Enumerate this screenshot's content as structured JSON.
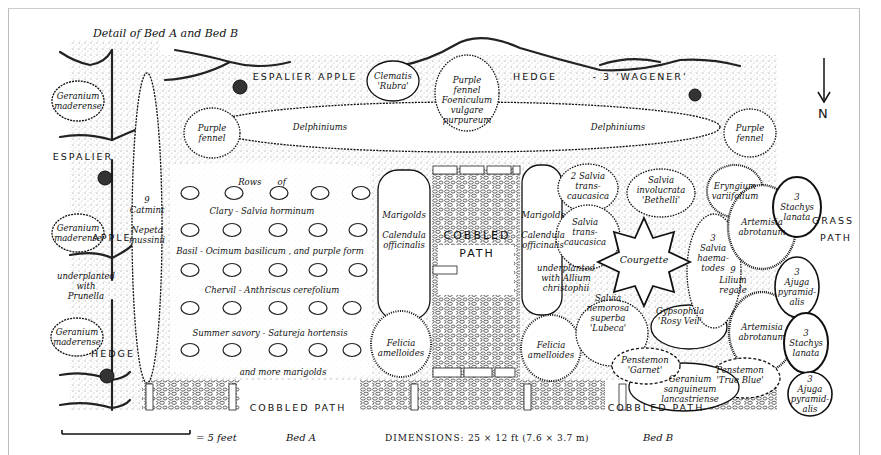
{
  "title": "Detail of Bed A and Bed B",
  "north_label": "N",
  "scale": {
    "label": "= 5 feet"
  },
  "beds": {
    "a": "Bed A",
    "b": "Bed B"
  },
  "dimensions": {
    "prefix": "DIMENSIONS:",
    "value": "25 × 12 ft (7.6 × 3.7 m)"
  },
  "hedge_labels": {
    "top_1": "ESPALIER APPLE",
    "top_2": "HEDGE",
    "top_3": "- 3 'WAGENER'",
    "left_1": "ESPALIER",
    "left_2": "APPLE",
    "left_3": "HEDGE"
  },
  "paths": {
    "cobbled_bottom_left": "COBBLED PATH",
    "cobbled_bottom_right": "COBBLED PATH",
    "cobbled_center_1": "COBBLED",
    "cobbled_center_2": "PATH",
    "grass_1": "GRASS",
    "grass_2": "PATH"
  },
  "plants": {
    "clematis": "Clematis\n'Rubra'",
    "purple_fennel_center": "Purple\nfennel\nFoeniculum\nvulgare\npurpureum",
    "purple_fennel_left": "Purple\nfennel",
    "purple_fennel_right": "Purple\nfennel",
    "delphiniums_left": "Delphiniums",
    "delphiniums_right": "Delphiniums",
    "geranium_1": "Geranium\nmaderense",
    "geranium_2": "Geranium\nmaderense",
    "geranium_3": "Geranium\nmaderense",
    "prunella": "underplanted\nwith\nPrunella",
    "catmint": "9\nCatmint\n\nNepeta\nmussinii",
    "rows_of": "Rows      of",
    "clary": "Clary - Salvia horminum",
    "basil": "Basil - Ocimum basilicum , and purple form",
    "chervil": "Chervil - Anthriscus cerefolium",
    "savory": "Summer savory - Satureja hortensis",
    "more_marigolds": "and more marigolds",
    "marigolds_left": "Marigolds\n\nCalendula\nofficinalis",
    "marigolds_right": "Marigolds\n\nCalendula\nofficinalis",
    "felicia_left": "Felicia\namelloides",
    "felicia_right": "Felicia\namelloides",
    "salvia_trans_1": "2 Salvia\ntrans-\ncaucasica",
    "salvia_trans_2": "Salvia\ntrans-\ncaucasica",
    "salvia_involucrata": "Salvia\ninvolucrata\n'Bethelli'",
    "eryngium": "Eryngium\nvariifolium",
    "courgette": "Courgette",
    "allium": "underplanted\nwith Allium\nchristophii",
    "salvia_nemorosa": "Salvia\nnemorosa\nsuperba\n'Lubeca'",
    "gypsophila": "Gypsophila\n'Rosy Veil'",
    "salvia_haematodes": "3\nSalvia\nhaema-\ntodes",
    "lilium": "9\nLilium\nregale",
    "artemisia_1": "Artemisia\nabrotanum",
    "artemisia_2": "Artemisia\nabrotanum",
    "stachys_1": "3\nStachys\nlanata",
    "stachys_2": "3\nStachys\nlanata",
    "ajuga_1": "3\nAjuga\npyramid-\nalis",
    "ajuga_2": "3\nAjuga\npyramid-\nalis",
    "penstemon_blue": "Penstemon\n'True Blue'",
    "penstemon_garnet": "Penstemon\n'Garnet'",
    "geranium_sang": "Geranium\nsanguineum\nlancastriense"
  },
  "colors": {
    "ink": "#111111",
    "stipple": "#d9d9d9",
    "paper": "#ffffff"
  }
}
